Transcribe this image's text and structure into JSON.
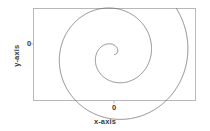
{
  "figure": {
    "background_color": "#ffffff",
    "frame_color": "#b8b8b8",
    "curve_color": "#5c5c5c",
    "text_color": "#3c3c3c"
  },
  "axes": {
    "x_label": "x-axis",
    "y_label": "y-axis",
    "x_ticks": [
      "0"
    ],
    "y_ticks": [
      "0"
    ]
  },
  "chart_data": {
    "type": "line",
    "title": "",
    "xlabel": "x-axis",
    "ylabel": "y-axis",
    "grid": false,
    "legend": false,
    "xlim": [
      -1.6,
      1.6
    ],
    "ylim": [
      -0.9,
      0.9
    ],
    "xticks": [
      0
    ],
    "yticks": [
      0
    ],
    "xticklabels": [
      "0"
    ],
    "yticklabels": [
      "0"
    ],
    "series": [
      {
        "name": "spiral",
        "parametric": true,
        "formula": "r = a * theta ; x = r*cos(theta), y = r*sin(theta)",
        "theta_range": [
          0.0,
          13.2
        ],
        "a": 0.115,
        "color": "#5c5c5c",
        "linewidth": 0.6,
        "x": [
          0.0,
          0.05,
          0.09,
          0.1,
          0.08,
          0.03,
          -0.04,
          -0.11,
          -0.17,
          -0.2,
          -0.19,
          -0.14,
          -0.06,
          0.05,
          0.17,
          0.27,
          0.34,
          0.37,
          0.34,
          0.26,
          0.13,
          -0.04,
          -0.22,
          -0.39,
          -0.52,
          -0.6,
          -0.61,
          -0.55,
          -0.41,
          -0.21,
          0.04,
          0.32,
          0.59,
          0.83,
          1.01,
          1.1,
          1.09,
          0.97,
          0.74,
          0.43,
          0.05,
          -0.35,
          -0.74,
          -1.08,
          -1.33,
          -1.47,
          -1.47,
          -1.34,
          -1.08
        ],
        "y": [
          0.0,
          0.03,
          0.09,
          0.16,
          0.22,
          0.25,
          0.25,
          0.21,
          0.13,
          0.02,
          -0.11,
          -0.23,
          -0.32,
          -0.37,
          -0.37,
          -0.31,
          -0.2,
          -0.04,
          0.14,
          0.32,
          0.47,
          0.57,
          0.6,
          0.55,
          0.42,
          0.22,
          -0.03,
          -0.3,
          -0.56,
          -0.78,
          -0.93,
          -0.99,
          -0.94,
          -0.78,
          -0.52,
          -0.19,
          0.19,
          0.58,
          0.93,
          1.2,
          1.36,
          1.39,
          1.28,
          1.03,
          0.66,
          0.2,
          -0.3,
          -0.79,
          -1.22
        ]
      }
    ]
  }
}
